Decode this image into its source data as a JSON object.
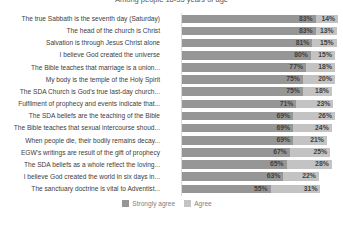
{
  "chart_data": {
    "type": "bar",
    "subtype": "stacked-horizontal",
    "title": "Among people 18-35 years of age",
    "xlabel": "",
    "ylabel": "",
    "grid": false,
    "legend_position": "bottom",
    "value_suffix": "%",
    "xlim": [
      0,
      100
    ],
    "categories": [
      "The true Sabbath is the seventh day (Saturday)",
      "The head of the church is Christ",
      "Salvation is through Jesus Christ alone",
      "I believe God created the universe",
      "The Bible teaches that marriage is a union...",
      "My body is the temple of the Holy Spirit",
      "The SDA Church is God's true last-day church...",
      "Fulfilment of prophecy and events indicate that...",
      "The SDA beliefs are the teaching of the Bible",
      "The Bible teaches that sexual intercourse shoud...",
      "When people die, their bodily remains decay...",
      "EGW's writings are result of the gift of prophecy",
      "The SDA beliefs  as a whole reflect the loving...",
      "I believe God created the world in six days in...",
      "The sanctuary doctrine is vital to Adventist..."
    ],
    "series": [
      {
        "name": "Strongly agree",
        "color": "#969696",
        "values": [
          83,
          83,
          81,
          80,
          77,
          75,
          75,
          71,
          69,
          69,
          69,
          67,
          65,
          63,
          55
        ]
      },
      {
        "name": "Agree",
        "color": "#c3c3c3",
        "values": [
          14,
          13,
          15,
          15,
          18,
          20,
          18,
          23,
          26,
          24,
          21,
          25,
          28,
          22,
          31
        ]
      }
    ]
  }
}
